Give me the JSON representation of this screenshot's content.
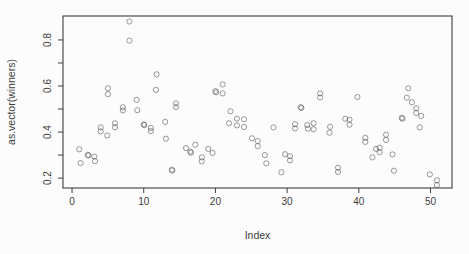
{
  "figure": {
    "background": "#fcfcfc",
    "axis_color": "#3d3d3d",
    "point_color": "#4a4a4a"
  },
  "chart_data": {
    "type": "scatter",
    "title": "",
    "xlabel": "Index",
    "ylabel": "as.vector(winners)",
    "xlim": [
      -1.26,
      53.0
    ],
    "ylim": [
      0.157,
      0.904
    ],
    "x_ticks": [
      0,
      10,
      20,
      30,
      40,
      50
    ],
    "y_ticks": [
      0.2,
      0.3,
      0.4,
      0.5,
      0.6,
      0.7,
      0.8
    ],
    "y_labeled_ticks": [
      0.2,
      0.4,
      0.6,
      0.8
    ],
    "grid": "off",
    "legend": "none",
    "marker": "open-circle",
    "points": [
      [
        1.0,
        0.325
      ],
      [
        1.2,
        0.265
      ],
      [
        2.2,
        0.301
      ],
      [
        2.3,
        0.298
      ],
      [
        3.1,
        0.294
      ],
      [
        3.2,
        0.274
      ],
      [
        4.0,
        0.42
      ],
      [
        4.0,
        0.403
      ],
      [
        4.9,
        0.385
      ],
      [
        5.0,
        0.59
      ],
      [
        5.0,
        0.565
      ],
      [
        6.0,
        0.438
      ],
      [
        6.0,
        0.421
      ],
      [
        7.1,
        0.508
      ],
      [
        7.1,
        0.494
      ],
      [
        8.0,
        0.88
      ],
      [
        8.0,
        0.797
      ],
      [
        9.0,
        0.54
      ],
      [
        9.1,
        0.495
      ],
      [
        10.0,
        0.433
      ],
      [
        10.1,
        0.43
      ],
      [
        11.0,
        0.418
      ],
      [
        11.0,
        0.404
      ],
      [
        11.8,
        0.651
      ],
      [
        11.7,
        0.583
      ],
      [
        13.0,
        0.444
      ],
      [
        13.1,
        0.371
      ],
      [
        13.9,
        0.236
      ],
      [
        14.0,
        0.233
      ],
      [
        14.5,
        0.525
      ],
      [
        14.5,
        0.508
      ],
      [
        15.9,
        0.33
      ],
      [
        16.5,
        0.315
      ],
      [
        16.6,
        0.31
      ],
      [
        17.2,
        0.345
      ],
      [
        18.1,
        0.29
      ],
      [
        18.1,
        0.273
      ],
      [
        19.0,
        0.327
      ],
      [
        19.6,
        0.309
      ],
      [
        20.0,
        0.578
      ],
      [
        20.1,
        0.572
      ],
      [
        21.0,
        0.607
      ],
      [
        21.0,
        0.568
      ],
      [
        22.1,
        0.49
      ],
      [
        21.9,
        0.438
      ],
      [
        23.0,
        0.458
      ],
      [
        23.0,
        0.429
      ],
      [
        24.0,
        0.456
      ],
      [
        24.0,
        0.422
      ],
      [
        25.1,
        0.373
      ],
      [
        25.9,
        0.361
      ],
      [
        25.9,
        0.339
      ],
      [
        26.9,
        0.3
      ],
      [
        27.1,
        0.264
      ],
      [
        28.1,
        0.42
      ],
      [
        29.2,
        0.225
      ],
      [
        29.7,
        0.304
      ],
      [
        30.4,
        0.295
      ],
      [
        30.4,
        0.277
      ],
      [
        31.1,
        0.434
      ],
      [
        31.1,
        0.416
      ],
      [
        31.9,
        0.508
      ],
      [
        32.0,
        0.505
      ],
      [
        32.8,
        0.43
      ],
      [
        32.9,
        0.415
      ],
      [
        33.7,
        0.438
      ],
      [
        33.7,
        0.412
      ],
      [
        34.6,
        0.568
      ],
      [
        34.6,
        0.55
      ],
      [
        36.0,
        0.423
      ],
      [
        35.9,
        0.397
      ],
      [
        37.1,
        0.245
      ],
      [
        37.1,
        0.227
      ],
      [
        38.1,
        0.458
      ],
      [
        38.7,
        0.453
      ],
      [
        38.7,
        0.432
      ],
      [
        39.8,
        0.552
      ],
      [
        40.9,
        0.375
      ],
      [
        40.9,
        0.357
      ],
      [
        42.4,
        0.327
      ],
      [
        41.9,
        0.29
      ],
      [
        42.9,
        0.332
      ],
      [
        42.9,
        0.312
      ],
      [
        43.8,
        0.388
      ],
      [
        43.8,
        0.366
      ],
      [
        44.7,
        0.303
      ],
      [
        44.9,
        0.232
      ],
      [
        46.0,
        0.462
      ],
      [
        46.1,
        0.458
      ],
      [
        46.9,
        0.59
      ],
      [
        46.7,
        0.549
      ],
      [
        47.4,
        0.529
      ],
      [
        48.0,
        0.503
      ],
      [
        48.0,
        0.483
      ],
      [
        48.7,
        0.47
      ],
      [
        48.5,
        0.42
      ],
      [
        49.9,
        0.216
      ],
      [
        50.9,
        0.19
      ],
      [
        50.9,
        0.17
      ]
    ]
  }
}
